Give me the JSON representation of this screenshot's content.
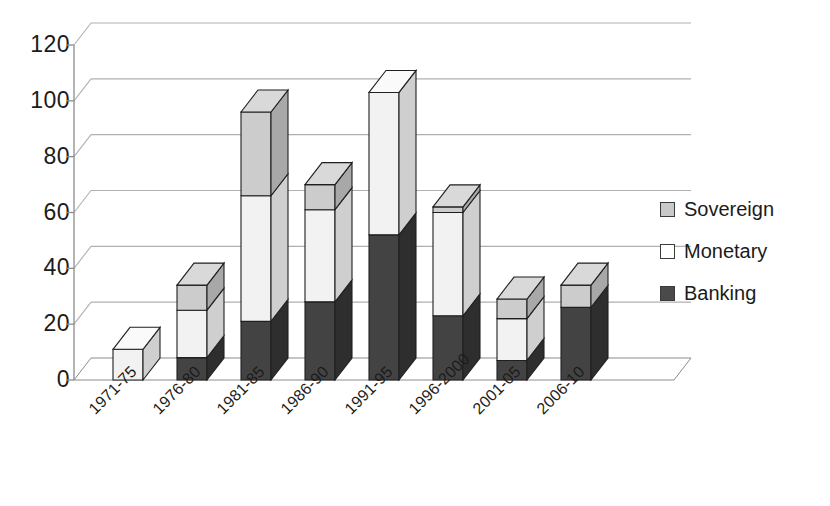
{
  "chart_data": {
    "type": "bar",
    "subtype": "stacked-3d-column",
    "title": "",
    "subtitle": "",
    "xlabel": "",
    "ylabel": "",
    "ylim": [
      0,
      120
    ],
    "yticks": [
      0,
      20,
      40,
      60,
      80,
      100,
      120
    ],
    "ytick_labels": [
      "0",
      "20",
      "40",
      "60",
      "80",
      "100",
      "120"
    ],
    "grid": true,
    "grid_axis": "y",
    "legend_position": "right",
    "categories": [
      "1971-75",
      "1976-80",
      "1981-85",
      "1986-90",
      "1991-95",
      "1996-2000",
      "2001-05",
      "2006-10"
    ],
    "series": [
      {
        "name": "Banking",
        "color": "#434343",
        "values": [
          0,
          8,
          21,
          28,
          52,
          23,
          7,
          26
        ]
      },
      {
        "name": "Monetary",
        "color": "#f2f2f2",
        "values": [
          11,
          17,
          45,
          33,
          51,
          37,
          15,
          0
        ]
      },
      {
        "name": "Sovereign",
        "color": "#c9c9c9",
        "values": [
          0,
          9,
          30,
          9,
          0,
          2,
          7,
          8
        ]
      }
    ],
    "totals": [
      11,
      34,
      96,
      70,
      103,
      62,
      29,
      34
    ]
  },
  "legend": {
    "items": [
      {
        "label": "Sovereign",
        "swatch": "#c9c9c9",
        "icon": "legend-swatch-sovereign"
      },
      {
        "label": "Monetary",
        "swatch": "#ffffff",
        "icon": "legend-swatch-monetary"
      },
      {
        "label": "Banking",
        "swatch": "#4a4a4a",
        "icon": "legend-swatch-banking"
      }
    ]
  },
  "colors": {
    "banking_front": "#434343",
    "banking_side": "#2e2e2e",
    "banking_top": "#5c5c5c",
    "monetary_front": "#f2f2f2",
    "monetary_side": "#cfcfcf",
    "monetary_top": "#fafafa",
    "sovereign_front": "#cccccc",
    "sovereign_side": "#a8a8a8",
    "sovereign_top": "#d9d9d9",
    "gridline": "#b0b0b0",
    "axis": "#8c8c8c",
    "text": "#1b1b1b"
  }
}
